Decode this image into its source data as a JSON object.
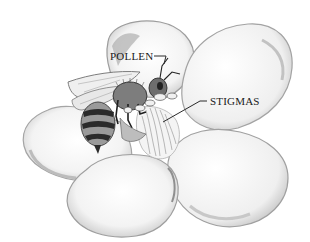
{
  "figure": {
    "labels": {
      "pollen": "POLLEN",
      "stigmas": "STIGMAS"
    },
    "colors": {
      "background": "#ffffff",
      "petal_fill": "#f7f7f7",
      "petal_shadow": "#b9b9b9",
      "line": "#2a2a2a",
      "bee_dark": "#2b2b2b",
      "bee_mid": "#8a8a8a"
    }
  }
}
